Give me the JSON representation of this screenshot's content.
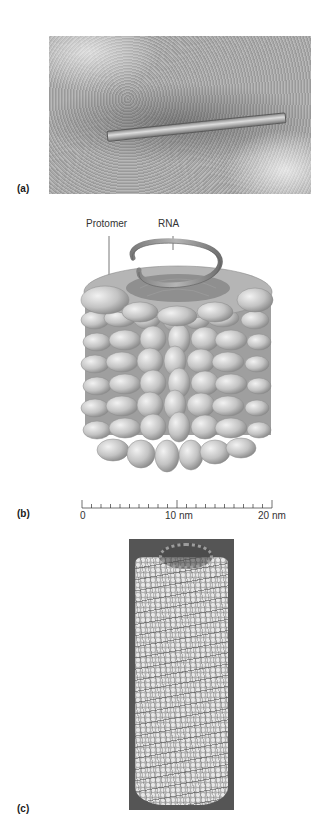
{
  "figure": {
    "panels": [
      {
        "id": "a",
        "label": "(a)",
        "content": "Electron micrograph of rod-shaped virus particle"
      },
      {
        "id": "b",
        "label": "(b)",
        "content": "Schematic of helical capsid with protomers and RNA",
        "callouts": {
          "protomer": "Protomer",
          "rna": "RNA"
        },
        "scale_bar": {
          "ticks": [
            "0",
            "10 nm",
            "20 nm"
          ],
          "minor_tick_count": 20
        }
      },
      {
        "id": "c",
        "label": "(c)",
        "content": "Space-filling computer model of helical capsid"
      }
    ]
  },
  "colors": {
    "background": "#ffffff",
    "micrograph_gray": "#ababab",
    "protomer_gray": "#c4c4c4",
    "model_background": "#555555"
  }
}
